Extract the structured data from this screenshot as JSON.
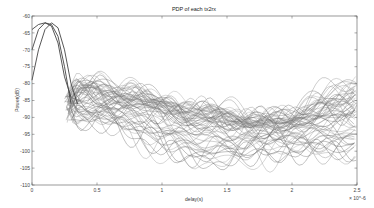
{
  "chart_data": {
    "type": "line",
    "title": "PDP of each tx2rx",
    "xlabel": "delay(s)",
    "ylabel": "Power(dB)",
    "x_exponent_label": "× 10^-6",
    "xlim": [
      0,
      2.5
    ],
    "ylim": [
      -110,
      -60
    ],
    "xticks": [
      0,
      0.5,
      1,
      1.5,
      2,
      2.5
    ],
    "xtick_labels": [
      "0",
      "0.5",
      "1",
      "1.5",
      "2",
      "2.5"
    ],
    "yticks": [
      -60,
      -65,
      -70,
      -75,
      -80,
      -85,
      -90,
      -95,
      -100,
      -105,
      -110
    ],
    "ytick_labels": [
      "-60",
      "-65",
      "-70",
      "-75",
      "-80",
      "-85",
      "-90",
      "-95",
      "-100",
      "-105",
      "-110"
    ],
    "grid": false,
    "legend": null,
    "series_count_estimate": 60,
    "highlight_series": [
      {
        "name": "peak-a",
        "x": [
          0,
          0.05,
          0.1,
          0.15,
          0.2,
          0.25,
          0.3
        ],
        "values": [
          -64,
          -62.5,
          -62,
          -63,
          -68,
          -78,
          -84
        ]
      },
      {
        "name": "peak-b",
        "x": [
          0,
          0.05,
          0.1,
          0.15,
          0.2,
          0.25,
          0.3
        ],
        "values": [
          -70,
          -64,
          -62,
          -62.5,
          -66,
          -75,
          -86
        ]
      },
      {
        "name": "peak-c",
        "x": [
          0,
          0.05,
          0.1,
          0.15,
          0.2,
          0.25,
          0.3,
          0.35
        ],
        "values": [
          -79,
          -70,
          -64,
          -62,
          -63.5,
          -70,
          -80,
          -86
        ]
      }
    ],
    "envelope": {
      "x": [
        0.3,
        0.5,
        0.75,
        1.0,
        1.25,
        1.5,
        1.75,
        2.0,
        2.25,
        2.5
      ],
      "upper": [
        -80,
        -80,
        -82,
        -84,
        -87,
        -89,
        -90,
        -89,
        -86,
        -80
      ],
      "mean": [
        -84,
        -85,
        -87,
        -89,
        -91,
        -93,
        -93,
        -92,
        -92,
        -91
      ],
      "lower": [
        -92,
        -91,
        -95,
        -100,
        -104,
        -104,
        -101,
        -101,
        -102,
        -100
      ]
    },
    "rising_group_end_value": -80,
    "lower_group_end_range": [
      -90,
      -100
    ]
  }
}
